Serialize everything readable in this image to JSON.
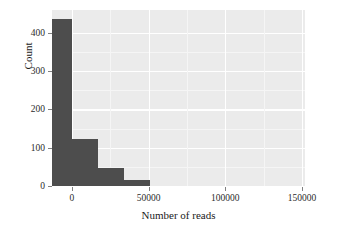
{
  "chart_data": {
    "type": "bar",
    "title": "",
    "subtitle": "",
    "xlabel": "Number of reads",
    "ylabel": "Count",
    "xlim": [
      -13000,
      152000
    ],
    "ylim": [
      0,
      460
    ],
    "grid": true,
    "legend": "none",
    "style": "ggplot2-theme-gray",
    "bin_width": 17000,
    "x_tick_labels": [
      "0",
      "50000",
      "100000",
      "150000"
    ],
    "x_tick_values": [
      0,
      50000,
      100000,
      150000
    ],
    "y_tick_labels": [
      "0",
      "100",
      "200",
      "300",
      "400"
    ],
    "y_tick_values": [
      0,
      100,
      200,
      300,
      400
    ],
    "categories": [
      "-8500",
      "8500",
      "25500",
      "42500",
      "59500",
      "76500",
      "93500",
      "110500",
      "127500",
      "144500"
    ],
    "bin_centers": [
      -8500,
      8500,
      25500,
      42500,
      59500,
      76500,
      93500,
      110500,
      127500,
      144500
    ],
    "values": [
      437,
      124,
      47,
      16,
      0,
      0,
      0,
      0,
      0,
      0
    ],
    "series": [
      {
        "name": "Count of samples",
        "values": [
          437,
          124,
          47,
          16,
          0,
          0,
          0,
          0,
          0,
          0
        ]
      }
    ],
    "bar_color": "#4d4d4d",
    "panel_color": "#ebebeb",
    "grid_color": "#ffffff"
  },
  "axes": {
    "x_label": "Number of reads",
    "y_label": "Count"
  }
}
